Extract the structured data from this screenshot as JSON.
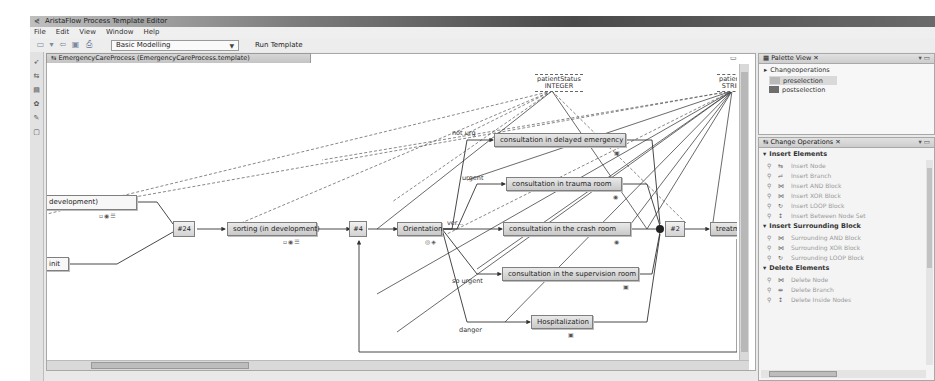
{
  "window": {
    "title": "AristaFlow Process Template Editor"
  },
  "menu": [
    "File",
    "Edit",
    "View",
    "Window",
    "Help"
  ],
  "toolbar": {
    "mode_select": "Basic Modelling",
    "run_template_label": "Run Template",
    "icons": [
      "new-icon",
      "dropdown-icon",
      "back-icon",
      "save-icon",
      "print-icon"
    ]
  },
  "editor": {
    "tab_label": "EmergencyCareProcess (EmergencyCareProcess.template)",
    "data_objects": [
      {
        "name": "patientStatus",
        "type": "INTEGER"
      },
      {
        "name": "patientID",
        "type": "STRING"
      }
    ],
    "nodes": {
      "dev_partial": "development)",
      "init_partial": "init",
      "xor_join_left": "#24",
      "sorting": "sorting (in development)",
      "loop_start": "#4",
      "orientation": "Orientation",
      "delayed": "consultation in delayed emergency",
      "trauma": "consultation in trauma room",
      "crash": "consultation in the crash room",
      "supervision": "consultation in the supervision room",
      "hospitalization": "Hospitalization",
      "join_right": "#2",
      "treatment": "treatment and ca"
    },
    "edge_labels": {
      "not_urgent": "not urg",
      "urgent": "urgent",
      "very_urgent": "ver...",
      "so_urgent": "so urgent",
      "danger": "danger"
    }
  },
  "palette": {
    "tab_label": "Palette View",
    "group": "Changeoperations",
    "items": [
      {
        "label": "preselection",
        "color": "#b9b9b9",
        "selected": true
      },
      {
        "label": "postselection",
        "color": "#6e6e6e",
        "selected": false
      }
    ]
  },
  "change_operations": {
    "tab_label": "Change Operations",
    "sections": [
      {
        "title": "Insert Elements",
        "items": [
          "Insert Node",
          "Insert Branch",
          "Insert AND Block",
          "Insert XOR Block",
          "Insert LOOP Block",
          "Insert Between Node Set"
        ]
      },
      {
        "title": "Insert Surrounding Block",
        "items": [
          "Surrounding AND Block",
          "Surrounding XOR Block",
          "Surrounding LOOP Block"
        ]
      },
      {
        "title": "Delete Elements",
        "items": [
          "Delete Node",
          "Delete Branch",
          "Delete Inside Nodes"
        ]
      }
    ]
  }
}
